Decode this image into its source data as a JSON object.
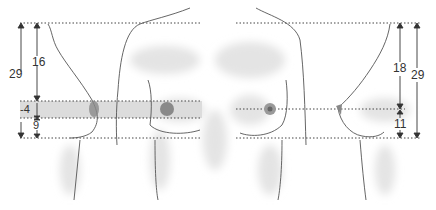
{
  "diagram": {
    "left_figure": {
      "labels": {
        "total": "29",
        "upper": "16",
        "offset": "-4",
        "lower": "9"
      }
    },
    "right_figure": {
      "labels": {
        "upper": "18",
        "total": "29",
        "lower": "11"
      }
    },
    "colors": {
      "line": "#555555",
      "dotted": "#444444",
      "band": "#d9d9d9",
      "shade": "#e6e6e6"
    }
  }
}
